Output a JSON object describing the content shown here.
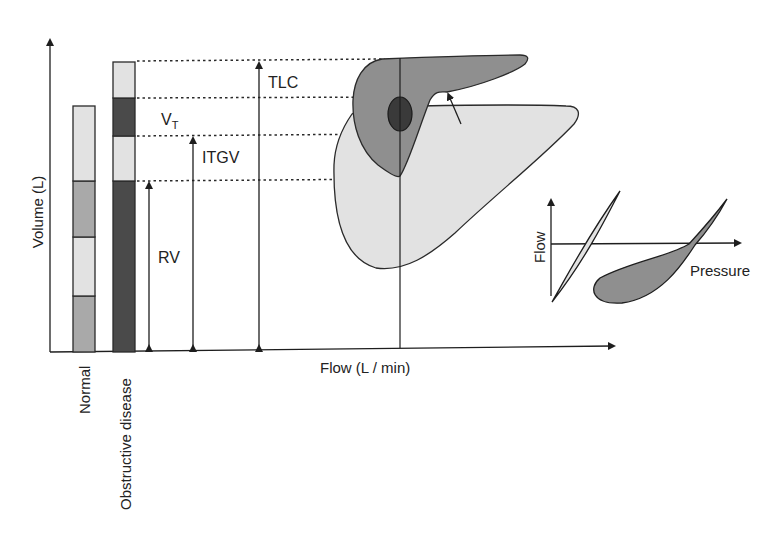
{
  "diagram": {
    "axes": {
      "y_label": "Volume (L)",
      "x_label": "Flow (L / min)"
    },
    "bars": [
      {
        "label": "Normal",
        "segments_bottom_to_top": [
          "mid-gray",
          "light-gray",
          "mid-gray",
          "light-gray"
        ]
      },
      {
        "label": "Obstructive disease",
        "segments_bottom_to_top": [
          "dark-gray",
          "light-gray",
          "dark-gray",
          "light-gray"
        ]
      }
    ],
    "volume_labels": {
      "tlc": "TLC",
      "vt_main": "V",
      "vt_sub": "T",
      "itgv": "ITGV",
      "rv": "RV"
    },
    "inset": {
      "y_label": "Flow",
      "x_label": "Pressure"
    },
    "colors": {
      "light_gray": "#e2e2e2",
      "mid_gray": "#a9a9a9",
      "dark_gray": "#4a4a4a",
      "loop_dark": "#8f8f8f",
      "ellipse": "#3a3a3a",
      "line": "#1e1e1e"
    }
  }
}
